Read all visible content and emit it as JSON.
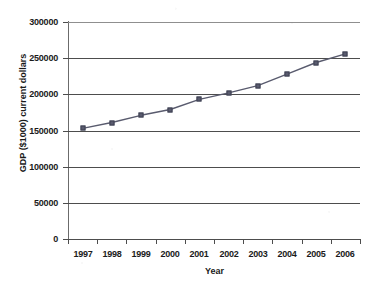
{
  "chart_data": {
    "type": "line",
    "title": "",
    "subtitle": "",
    "xlabel": "Year",
    "ylabel": "GDP ($1000) current dollars",
    "categories": [
      "1997",
      "1998",
      "1999",
      "2000",
      "2001",
      "2002",
      "2003",
      "2004",
      "2005",
      "2006"
    ],
    "values": [
      153000,
      161000,
      171000,
      179000,
      193000,
      202000,
      212000,
      228000,
      244000,
      256000
    ],
    "ylim": [
      0,
      300000
    ],
    "ytick_labels": [
      "0",
      "50000",
      "100000",
      "150000",
      "200000",
      "250000",
      "300000"
    ],
    "ytick_values": [
      0,
      50000,
      100000,
      150000,
      200000,
      250000,
      300000
    ],
    "grid": true,
    "grid_axis": "y",
    "legend": false,
    "legend_position": "none",
    "marker": "square",
    "series": [
      {
        "name": "GDP",
        "color": "#595b6e",
        "values": [
          153000,
          161000,
          171000,
          179000,
          193000,
          202000,
          212000,
          228000,
          244000,
          256000
        ]
      }
    ],
    "colors": {
      "series": "#595b6e",
      "gridline": "#4d4d4d",
      "axis": "#4d4d4d",
      "text": "#1a1a1a",
      "background": "#ffffff"
    }
  }
}
